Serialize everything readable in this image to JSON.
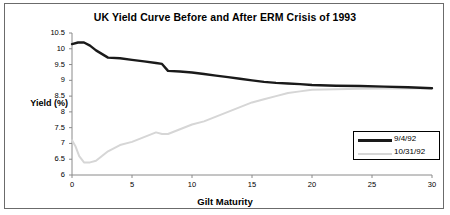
{
  "chart_data": {
    "type": "line",
    "title": "UK Yield Curve Before and After ERM Crisis of 1993",
    "xlabel": "Gilt Maturity",
    "ylabel": "Yield (%)",
    "xlim": [
      0,
      30
    ],
    "ylim": [
      6,
      10.5
    ],
    "xticks": [
      0,
      5,
      10,
      15,
      20,
      25,
      30
    ],
    "yticks": [
      6,
      6.5,
      7,
      7.5,
      8,
      8.5,
      9,
      9.5,
      10,
      10.5
    ],
    "grid": false,
    "legend_position": "bottom-right",
    "series": [
      {
        "name": "9/4/92",
        "color": "#1a1a1a",
        "x": [
          0,
          0.5,
          1,
          1.5,
          2,
          3,
          4,
          5,
          6,
          7,
          7.5,
          8,
          9,
          10,
          11,
          12,
          13,
          14,
          15,
          16,
          17,
          18,
          19,
          20,
          22,
          24,
          26,
          28,
          30
        ],
        "values": [
          10.15,
          10.2,
          10.2,
          10.1,
          9.95,
          9.72,
          9.7,
          9.65,
          9.6,
          9.55,
          9.52,
          9.3,
          9.28,
          9.25,
          9.2,
          9.15,
          9.1,
          9.05,
          9.0,
          8.95,
          8.92,
          8.9,
          8.88,
          8.85,
          8.83,
          8.82,
          8.8,
          8.78,
          8.75
        ]
      },
      {
        "name": "10/31/92",
        "color": "#d6d6d6",
        "x": [
          0,
          0.3,
          0.6,
          1,
          1.5,
          2,
          2.5,
          3,
          4,
          5,
          6,
          7,
          7.5,
          8,
          9,
          10,
          11,
          12,
          13,
          14,
          15,
          16,
          17,
          18,
          19,
          20,
          22,
          24,
          26,
          28,
          30
        ],
        "values": [
          7.1,
          6.9,
          6.6,
          6.4,
          6.4,
          6.45,
          6.6,
          6.75,
          6.95,
          7.05,
          7.2,
          7.35,
          7.3,
          7.3,
          7.45,
          7.6,
          7.7,
          7.85,
          8.0,
          8.15,
          8.3,
          8.4,
          8.5,
          8.6,
          8.65,
          8.7,
          8.72,
          8.73,
          8.74,
          8.74,
          8.75
        ]
      }
    ]
  },
  "legend": {
    "entries": [
      {
        "label": "9/4/92"
      },
      {
        "label": "10/31/92"
      }
    ]
  }
}
